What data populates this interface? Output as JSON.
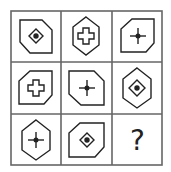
{
  "puzzle": {
    "rows": 3,
    "cols": 3,
    "line_color": "#555555",
    "shape_color": "#222222",
    "cells": [
      {
        "row": 0,
        "col": 0,
        "outer": "pentagon-cut-top-right",
        "inner": "diamond-with-dot"
      },
      {
        "row": 0,
        "col": 1,
        "outer": "hexagon-vertical",
        "inner": "hollow-cross"
      },
      {
        "row": 0,
        "col": 2,
        "outer": "pentagon-cut-top-left-bottom-right",
        "inner": "thin-cross-with-dot"
      },
      {
        "row": 1,
        "col": 0,
        "outer": "pentagon-cut-top-left-bottom-right",
        "inner": "hollow-cross"
      },
      {
        "row": 1,
        "col": 1,
        "outer": "pentagon-cut-top-right",
        "inner": "thin-cross-with-dot"
      },
      {
        "row": 1,
        "col": 2,
        "outer": "hexagon-vertical",
        "inner": "diamond-with-dot"
      },
      {
        "row": 2,
        "col": 0,
        "outer": "hexagon-vertical",
        "inner": "thin-cross-with-dot"
      },
      {
        "row": 2,
        "col": 1,
        "outer": "pentagon-cut-top-left-bottom-right",
        "inner": "diamond-with-dot"
      },
      {
        "row": 2,
        "col": 2,
        "outer": "unknown",
        "inner": "question-mark"
      }
    ],
    "missing_label": "?"
  }
}
